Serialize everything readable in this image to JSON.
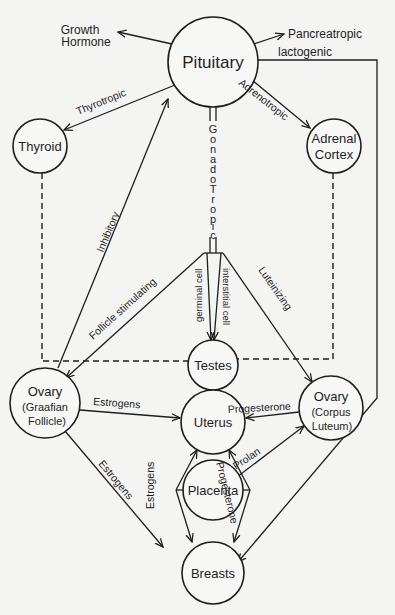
{
  "nodes": {
    "pituitary": {
      "label": "Pituitary"
    },
    "thyroid": {
      "label": "Thyroid"
    },
    "adrenal": {
      "line1": "Adrenal",
      "line2": "Cortex"
    },
    "testes": {
      "label": "Testes"
    },
    "ovary_graafian": {
      "line1": "Ovary",
      "line2": "(Graafian",
      "line3": "Follicle)"
    },
    "uterus": {
      "label": "Uterus"
    },
    "ovary_luteum": {
      "line1": "Ovary",
      "line2": "(Corpus",
      "line3": "Luteum)"
    },
    "placenta": {
      "label": "Placenta"
    },
    "breasts": {
      "label": "Breasts"
    }
  },
  "outputs": {
    "growth_hormone": {
      "line1": "Growth",
      "line2": "Hormone"
    },
    "pancreatropic": "Pancreatropic"
  },
  "edges": {
    "thyrotropic": "Thyrotropic",
    "adrenotropic": "Adrenotropic",
    "lactogenic": "lactogenic",
    "gonadotropic": [
      "G",
      "o",
      "n",
      "a",
      "d",
      "o",
      "T",
      "r",
      "o",
      "p",
      "i",
      "c"
    ],
    "inhibitory": "Inhibitory",
    "follicle_stimulating": "Follicle stimulating",
    "germinal_cell": "germinal cell",
    "interstitial_cell": "interstitial cell",
    "luteinizing": "Luteinizing",
    "estrogens_uterus": "Estrogens",
    "progesterone_uterus": "Progesterone",
    "prolan": "Prolan",
    "estrogens_breasts": "Estrogens",
    "estrogens_placenta": "Estrogens",
    "progesterone_placenta": "Progesterone"
  },
  "colors": {
    "ink": "#1e1e1e",
    "paper": "#f4f4f2"
  }
}
